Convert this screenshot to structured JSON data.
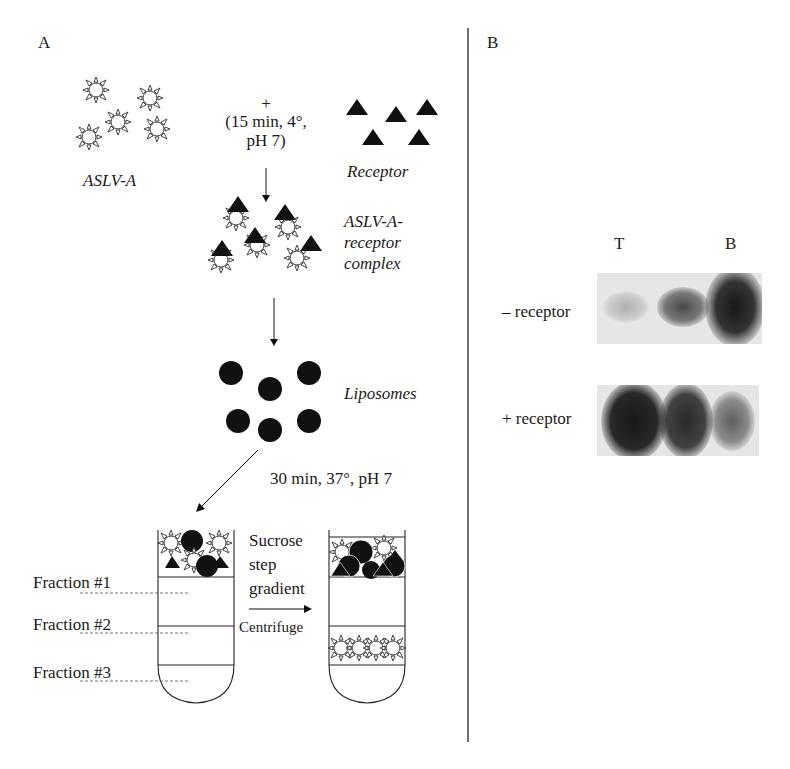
{
  "figure": {
    "panel_a": {
      "label": "A",
      "virus_label": "ASLV-A",
      "plus_sign": "+",
      "incubation_line1": "(15 min, 4°,",
      "incubation_line2": "pH 7)",
      "receptor_label": "Receptor",
      "complex_label_line1": "ASLV-A-",
      "complex_label_line2": "receptor",
      "complex_label_line3": "complex",
      "liposomes_label": "Liposomes",
      "fusion_conditions": "30 min, 37°, pH 7",
      "gradient_label_line1": "Sucrose",
      "gradient_label_line2": "step",
      "gradient_label_line3": "gradient",
      "centrifuge_label": "Centrifuge",
      "fractions": [
        {
          "label": "Fraction #1"
        },
        {
          "label": "Fraction #2"
        },
        {
          "label": "Fraction #3"
        }
      ]
    },
    "panel_b": {
      "label": "B",
      "lane_labels": {
        "top": "T",
        "bottom": "B"
      },
      "rows": [
        {
          "label": "– receptor",
          "band_intensities": [
            0.25,
            0.65,
            0.95
          ]
        },
        {
          "label": "+ receptor",
          "band_intensities": [
            0.95,
            0.85,
            0.55
          ]
        }
      ]
    },
    "colors": {
      "ink": "#1a1a1a",
      "gel_background": "#e6e6e6",
      "band": "#1e1e1e"
    }
  }
}
